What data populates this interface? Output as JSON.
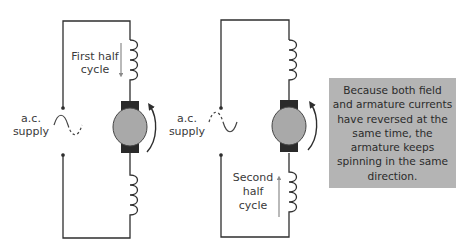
{
  "diagram": {
    "colors": {
      "wire": "#2e2e2e",
      "armature_fill": "#a9a9a9",
      "brush": "#2a2a2a",
      "current_arrow": "#8a8a8a",
      "note_bg": "#b4b4b4"
    },
    "circuits": [
      {
        "id": "first",
        "supply_label_line1": "a.c.",
        "supply_label_line2": "supply",
        "half_cycle_line1": "First half",
        "half_cycle_line2": "cycle",
        "current_arrow_direction": "down",
        "rotation": "anticlockwise"
      },
      {
        "id": "second",
        "supply_label_line1": "a.c.",
        "supply_label_line2": "supply",
        "half_cycle_line1": "Second",
        "half_cycle_line2": "half",
        "half_cycle_line3": "cycle",
        "current_arrow_direction": "up",
        "rotation": "anticlockwise"
      }
    ],
    "note": "Because both field and armature currents have reversed at the same time, the armature keeps spinning in the same direction."
  }
}
